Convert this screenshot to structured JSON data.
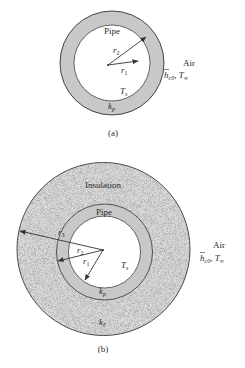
{
  "figure_a": {
    "caption": "(a)",
    "pipe_label": "Pipe",
    "r_outer_label": "r",
    "r_outer_sub": "2",
    "r_inner_label": "r",
    "r_inner_sub": "1",
    "temp_label": "T",
    "temp_sub": "s",
    "conductivity_label": "k",
    "conductivity_sub": "p",
    "air_label": "Air",
    "h_label": "h",
    "h_sub": "c0",
    "tinf_sep": ", ",
    "tinf_label": "T",
    "tinf_sub": "∞"
  },
  "figure_b": {
    "caption": "(b)",
    "insulation_label": "Insulation",
    "pipe_label": "Pipe",
    "r3_label": "r",
    "r3_sub": "3",
    "r2_label": "r",
    "r2_sub": "2",
    "r1_label": "r",
    "r1_sub": "1",
    "temp_label": "T",
    "temp_sub": "s",
    "pipe_conductivity_label": "k",
    "pipe_conductivity_sub": "p",
    "insulation_conductivity_label": "k",
    "insulation_conductivity_sub": "I",
    "air_label": "Air",
    "h_label": "h",
    "h_sub": "c0",
    "tinf_sep": ", ",
    "tinf_label": "T",
    "tinf_sub": "∞"
  },
  "colors": {
    "pipe_fill": "#c8c8c8",
    "insulation_fill": "#d9d9d9",
    "stroke": "#444444",
    "background": "#ffffff"
  }
}
